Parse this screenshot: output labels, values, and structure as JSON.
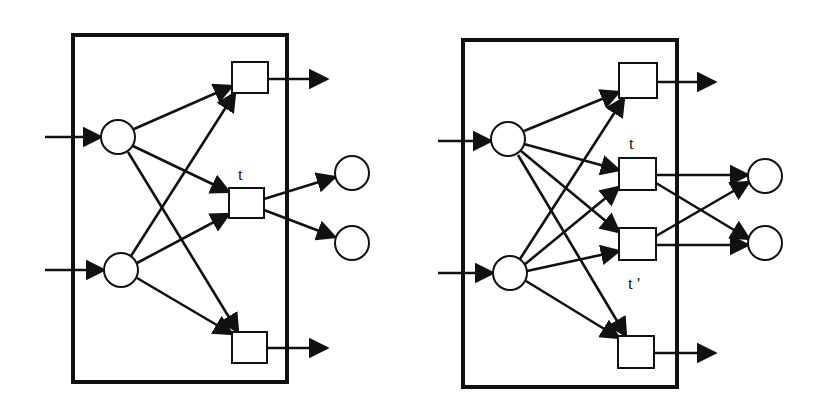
{
  "figure": {
    "colors": {
      "stroke": "#111111",
      "background": "#ffffff",
      "node_fill": "#ffffff"
    }
  },
  "diagrams": [
    {
      "id": "left",
      "box": {
        "x": 73,
        "y": 35,
        "w": 214,
        "h": 347
      },
      "places": [
        {
          "id": "p_in_top",
          "cx": 118,
          "cy": 137,
          "r": 17
        },
        {
          "id": "p_in_bottom",
          "cx": 121,
          "cy": 270,
          "r": 17
        },
        {
          "id": "p_out_top",
          "cx": 352,
          "cy": 173,
          "r": 17
        },
        {
          "id": "p_out_bottom",
          "cx": 352,
          "cy": 243,
          "r": 17
        }
      ],
      "transitions": [
        {
          "id": "t_top",
          "x": 232,
          "y": 62,
          "w": 36,
          "h": 31,
          "label": ""
        },
        {
          "id": "t",
          "x": 229,
          "y": 188,
          "w": 35,
          "h": 30,
          "label": "t",
          "label_x": 238,
          "label_y": 180
        },
        {
          "id": "t_bottom",
          "x": 232,
          "y": 332,
          "w": 35,
          "h": 31,
          "label": ""
        }
      ],
      "arcs": [
        {
          "x1": 45,
          "y1": 137,
          "x2": 101,
          "y2": 137
        },
        {
          "x1": 45,
          "y1": 270,
          "x2": 104,
          "y2": 270
        },
        {
          "x1": 134,
          "y1": 129,
          "x2": 232,
          "y2": 86
        },
        {
          "x1": 133,
          "y1": 146,
          "x2": 229,
          "y2": 192
        },
        {
          "x1": 128,
          "y1": 152,
          "x2": 238,
          "y2": 332
        },
        {
          "x1": 131,
          "y1": 256,
          "x2": 235,
          "y2": 93
        },
        {
          "x1": 137,
          "y1": 263,
          "x2": 229,
          "y2": 214
        },
        {
          "x1": 137,
          "y1": 278,
          "x2": 232,
          "y2": 334
        },
        {
          "x1": 264,
          "y1": 199,
          "x2": 335,
          "y2": 177
        },
        {
          "x1": 264,
          "y1": 210,
          "x2": 335,
          "y2": 237
        },
        {
          "x1": 268,
          "y1": 79,
          "x2": 327,
          "y2": 79
        },
        {
          "x1": 267,
          "y1": 348,
          "x2": 327,
          "y2": 348
        }
      ]
    },
    {
      "id": "right",
      "box": {
        "x": 463,
        "y": 40,
        "w": 214,
        "h": 347
      },
      "places": [
        {
          "id": "p_in_top",
          "cx": 508,
          "cy": 139,
          "r": 17
        },
        {
          "id": "p_in_bottom",
          "cx": 510,
          "cy": 273,
          "r": 17
        },
        {
          "id": "p_out_top",
          "cx": 765,
          "cy": 176,
          "r": 17
        },
        {
          "id": "p_out_bottom",
          "cx": 765,
          "cy": 243,
          "r": 17
        }
      ],
      "transitions": [
        {
          "id": "t_top",
          "x": 619,
          "y": 63,
          "w": 38,
          "h": 35,
          "label": ""
        },
        {
          "id": "t",
          "x": 619,
          "y": 158,
          "w": 37,
          "h": 32,
          "label": "t",
          "label_x": 629,
          "label_y": 149
        },
        {
          "id": "t_prime",
          "x": 619,
          "y": 228,
          "w": 37,
          "h": 32,
          "label": "t '",
          "label_x": 628,
          "label_y": 289
        },
        {
          "id": "t_bottom",
          "x": 618,
          "y": 336,
          "w": 36,
          "h": 32,
          "label": ""
        }
      ],
      "arcs": [
        {
          "x1": 438,
          "y1": 141,
          "x2": 491,
          "y2": 141
        },
        {
          "x1": 438,
          "y1": 273,
          "x2": 493,
          "y2": 273
        },
        {
          "x1": 524,
          "y1": 131,
          "x2": 619,
          "y2": 92
        },
        {
          "x1": 524,
          "y1": 144,
          "x2": 619,
          "y2": 170
        },
        {
          "x1": 521,
          "y1": 151,
          "x2": 619,
          "y2": 232
        },
        {
          "x1": 518,
          "y1": 155,
          "x2": 626,
          "y2": 336
        },
        {
          "x1": 520,
          "y1": 259,
          "x2": 624,
          "y2": 98
        },
        {
          "x1": 524,
          "y1": 265,
          "x2": 619,
          "y2": 187
        },
        {
          "x1": 527,
          "y1": 271,
          "x2": 619,
          "y2": 251
        },
        {
          "x1": 526,
          "y1": 281,
          "x2": 619,
          "y2": 338
        },
        {
          "x1": 656,
          "y1": 175,
          "x2": 748,
          "y2": 175
        },
        {
          "x1": 656,
          "y1": 183,
          "x2": 749,
          "y2": 239
        },
        {
          "x1": 656,
          "y1": 236,
          "x2": 749,
          "y2": 182
        },
        {
          "x1": 656,
          "y1": 245,
          "x2": 748,
          "y2": 245
        },
        {
          "x1": 657,
          "y1": 82,
          "x2": 715,
          "y2": 82
        },
        {
          "x1": 654,
          "y1": 353,
          "x2": 715,
          "y2": 353
        }
      ]
    }
  ],
  "labels": {
    "left_t": "t",
    "right_t": "t",
    "right_t_prime": "t '"
  }
}
